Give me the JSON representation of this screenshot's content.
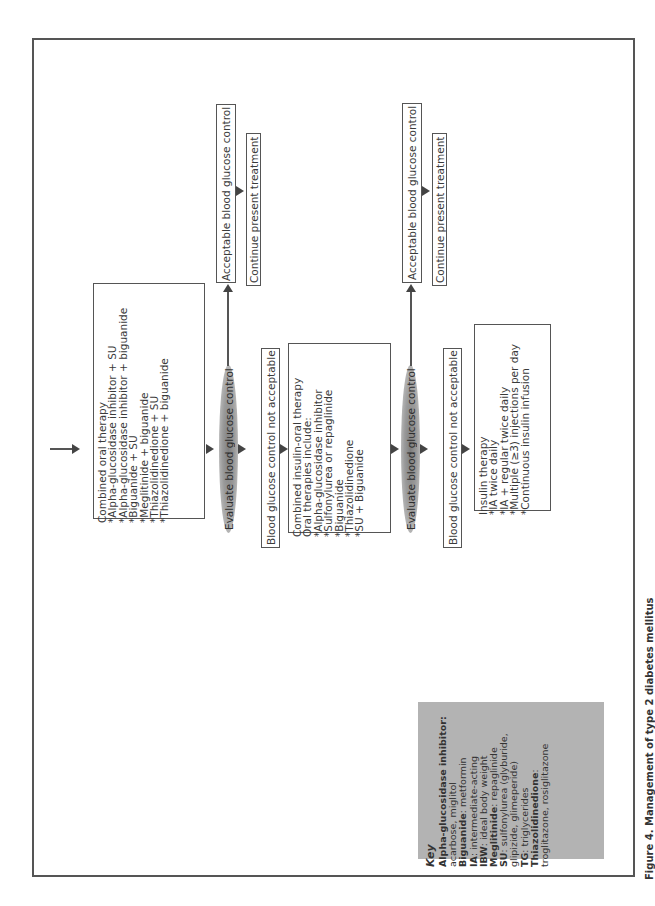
{
  "diagram": {
    "orientation": "rotated-90-ccw",
    "start_arrow": "entry",
    "step1": {
      "title": "Combined oral therapy",
      "items": [
        "*Alpha-glucosidase inhibitor + SU",
        "*Alpha-glucosidase inhibitor + biguanide",
        "*Biguanide + SU",
        "*Meglitinide + biguanide",
        "*Thiazolidinedione + SU",
        "*Thiazolidinedione + biguanide"
      ]
    },
    "evaluate1": "Evaluate blood glucose control",
    "acceptable1": "Acceptable blood glucose control",
    "continue1": "Continue present treatment",
    "not_acceptable1": "Blood glucose control not acceptable",
    "step2": {
      "title": "Combined insulin-oral therapy",
      "subtitle": "Oral therapies include:",
      "items": [
        "*Alpha-glucosidase inhibitor",
        "*Sulfonylurea or repaglinide",
        "*Biguanide",
        "*Thiazolidinedione",
        "*SU + Biguanide"
      ]
    },
    "evaluate2": "Evaluate blood glucose control",
    "acceptable2": "Acceptable blood glucose control",
    "continue2": "Continue present treatment",
    "not_acceptable2": "Blood glucose control not acceptable",
    "step3": {
      "title": "Insulin therapy",
      "items": [
        "*IA twice daily",
        "*IA + regular twice daily",
        "*Multiple (≥3) injections per day",
        "*Continuous insulin infusion"
      ]
    }
  },
  "key": {
    "title": "Key",
    "entries": [
      {
        "term": "Alpha-glucosidase inhibitor:",
        "def": ""
      },
      {
        "term": "",
        "def": "acarbose, miglitol"
      },
      {
        "term": "Biguanide",
        "def": ": metformin"
      },
      {
        "term": "IA",
        "def": ": intermediate-acting"
      },
      {
        "term": "IBW",
        "def": ": ideal body weight"
      },
      {
        "term": "Meglitinide",
        "def": ": repaglinide"
      },
      {
        "term": "SU",
        "def": ": sulfonylurea (glyburide,"
      },
      {
        "term": "",
        "def": "glipizide, glimeperide)"
      },
      {
        "term": "TG",
        "def": ": triglycerides"
      },
      {
        "term": "Thiazolidinedione",
        "def": ":"
      },
      {
        "term": "",
        "def": "troglitazone, rosiglitazone"
      }
    ]
  },
  "caption": "Figure 4. Management of type 2 diabetes mellitus"
}
